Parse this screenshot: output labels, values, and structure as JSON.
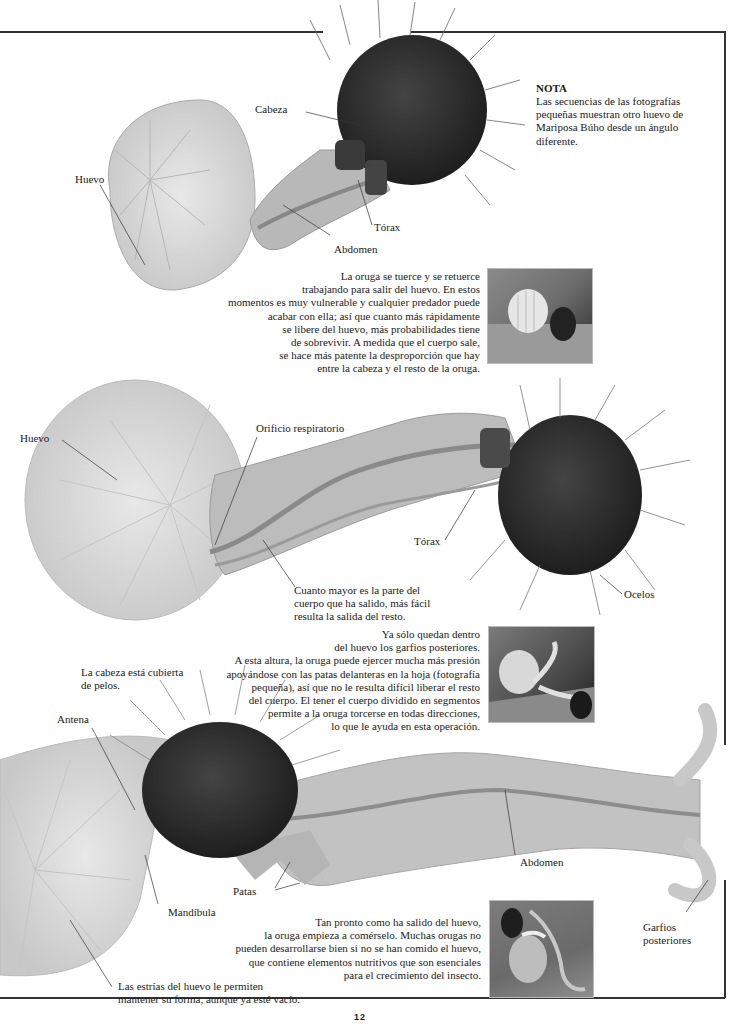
{
  "page": {
    "number": "12"
  },
  "note": {
    "title": "NOTA",
    "lines": [
      "Las secuencias de las fotografías",
      "pequeñas muestran otro huevo de",
      "Mariposa Búho desde un ángulo",
      "diferente."
    ]
  },
  "figure1": {
    "labels": {
      "head": "Cabeza",
      "egg": "Huevo",
      "thorax": "Tórax",
      "abdomen": "Abdomen"
    },
    "caption_lines": [
      "La oruga se tuerce y se retuerce",
      "trabajando para salir del huevo. En estos",
      "momentos es muy vulnerable y cualquier predador puede",
      "acabar con ella; así que cuanto más rápidamente",
      "se libere del huevo, más probabilidades tiene",
      "de sobrevivir. A medida que el cuerpo sale,",
      "se hace más patente la desproporción que hay",
      "entre la cabeza y el resto de la oruga."
    ],
    "photo_icon": "small-photo-caterpillar-emerging"
  },
  "figure2": {
    "labels": {
      "egg": "Huevo",
      "spiracle": "Orificio respiratorio",
      "thorax": "Tórax",
      "ocelli": "Ocelos"
    },
    "body_note_lines": [
      "Cuanto mayor es la parte del",
      "cuerpo que ha salido, más fácil",
      "resulta la salida del resto."
    ],
    "caption_lines": [
      "Ya sólo quedan dentro",
      "del huevo los garfios posteriores.",
      "A esta altura, la oruga puede ejercer mucha más presión",
      "apoyándose con las patas delanteras en la hoja (fotografía",
      "pequeña), así que no le resulta difícil liberar el resto",
      "del cuerpo. El tener el cuerpo dividido en segmentos",
      "permite a la oruga torcerse en todas direcciones,",
      "lo que le ayuda en esta operación."
    ],
    "photo_icon": "small-photo-caterpillar-leaving-egg"
  },
  "figure3": {
    "labels": {
      "hairs_note_lines": [
        "La cabeza está cubierta",
        "de pelos."
      ],
      "antenna": "Antena",
      "abdomen": "Abdomen",
      "legs": "Patas",
      "mandible": "Mandíbula",
      "rear_hooks_lines": [
        "Garfios",
        "posteriores"
      ]
    },
    "egg_note_lines": [
      "Las estrías del huevo le permiten",
      "mantener su forma, aunque ya esté vacío."
    ],
    "caption_lines": [
      "Tan pronto como ha salido del huevo,",
      "la oruga empieza a comérselo. Muchas orugas no",
      "pueden desarrollarse bien si no se han comido el huevo,",
      "que contiene elementos nutritivos que son esenciales",
      "para el crecimiento del insecto."
    ],
    "photo_icon": "small-photo-caterpillar-eating-egg"
  },
  "colors": {
    "frame": "#333333",
    "egg": "#dcdcdc",
    "body": "#bdbdbd",
    "head": "#2e2e2e",
    "text": "#1a1a1a"
  }
}
